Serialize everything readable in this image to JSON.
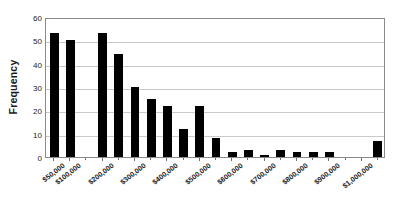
{
  "chart_data": {
    "type": "bar",
    "title": "",
    "xlabel": "",
    "ylabel": "Frequency",
    "ylim": [
      0,
      60
    ],
    "ytick_step": 10,
    "yticks": [
      0,
      10,
      20,
      30,
      40,
      50,
      60
    ],
    "ytick_labels": [
      "0",
      "10",
      "20",
      "30",
      "40",
      "50",
      "60"
    ],
    "grid": "horizontal",
    "legend": "none",
    "bar_color": "#000000",
    "x_tick_labels": [
      "$50,000",
      "$100,000",
      "$200,000",
      "$300,000",
      "$400,000",
      "$500,000",
      "$600,000",
      "$700,000",
      "$800,000",
      "$900,000",
      "$1,000,000"
    ],
    "categories": [
      "bin-1",
      "bin-2",
      "bin-3",
      "bin-4",
      "bin-5",
      "bin-6",
      "bin-7",
      "bin-8",
      "bin-9",
      "bin-10",
      "bin-11",
      "bin-12",
      "bin-13",
      "bin-14",
      "bin-15",
      "bin-16",
      "bin-17",
      "bin-18",
      "bin-19",
      "bin-20",
      "bin-21"
    ],
    "values": [
      53,
      50,
      0,
      53,
      44,
      30,
      25,
      22,
      12,
      22,
      8,
      2,
      3,
      1,
      3,
      2,
      2,
      2,
      0,
      0,
      7
    ]
  }
}
